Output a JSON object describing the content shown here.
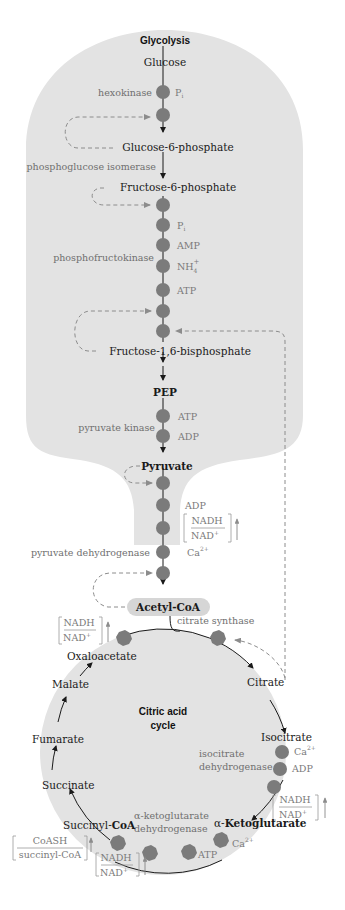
{
  "colors": {
    "background": "#ffffff",
    "region_fill": "#e3e3e3",
    "enzyme_dot": "#7b7b7b",
    "arrow": "#1a1a1a",
    "dashed": "#8c8c8c",
    "effector_text": "#7a7a7a",
    "enzyme_text": "#6f6f6f",
    "acetyl_pill": "#d6d6d6"
  },
  "glycolysis": {
    "title": "Glycolysis",
    "metabolites": {
      "glucose": "Glucose",
      "g6p": "Glucose-6-phosphate",
      "f6p": "Fructose-6-phosphate",
      "f16bp": "Fructose-1,6-bisphosphate",
      "pep": "PEP",
      "pyruvate": "Pyruvate"
    },
    "enzymes": {
      "hexokinase": "hexokinase",
      "pgi": "phosphoglucose isomerase",
      "pfk": "phosphofructokinase",
      "pk": "pyruvate kinase"
    },
    "effectors": {
      "hexokinase": [
        "Pi"
      ],
      "pfk": [
        "Pi",
        "AMP",
        "NH4+",
        "ATP"
      ],
      "pk": [
        "ATP",
        "ADP"
      ]
    },
    "effector_labels": {
      "pi_main": "P",
      "pi_sub": "i",
      "amp": "AMP",
      "nh_main": "NH",
      "nh_sub": "4",
      "nh_sup": "+",
      "atp": "ATP",
      "adp": "ADP"
    }
  },
  "pdh": {
    "enzyme": "pyruvate dehydrogenase",
    "effectors": {
      "adp": "ADP",
      "ratio_num": "NADH",
      "ratio_den_main": "NAD",
      "ratio_den_sup": "+",
      "ca_main": "Ca",
      "ca_sup": "2+"
    }
  },
  "acetyl_coa": "Acetyl-CoA",
  "citric_acid_cycle": {
    "title_line1": "Citric acid",
    "title_line2": "cycle",
    "metabolites": {
      "oxaloacetate": "Oxaloacetate",
      "citrate": "Citrate",
      "isocitrate": "Isocitrate",
      "akg_alpha": "α-",
      "akg": "Ketoglutarate",
      "succinyl_coa_a": "Succinyl-",
      "succinyl_coa_b": "CoA",
      "succinate": "Succinate",
      "fumarate": "Fumarate",
      "malate": "Malate"
    },
    "enzymes": {
      "citrate_synthase": "citrate synthase",
      "idh_line1": "isocitrate",
      "idh_line2": "dehydrogenase",
      "akgdh_line1": "α-ketoglutarate",
      "akgdh_line2": "dehydrogenase"
    },
    "effectors": {
      "cs_ratio_num": "NADH",
      "cs_ratio_den": "NAD",
      "plus": "+",
      "idh_ca": "Ca",
      "ca_sup": "2+",
      "idh_adp": "ADP",
      "idh_ratio_num": "NADH",
      "idh_ratio_den": "NAD",
      "akg_ca": "Ca",
      "akg_atp": "ATP",
      "akg_ratio_num": "NADH",
      "akg_ratio_den": "NAD",
      "coash_num": "CoASH",
      "coash_den": "succinyl-CoA"
    }
  }
}
